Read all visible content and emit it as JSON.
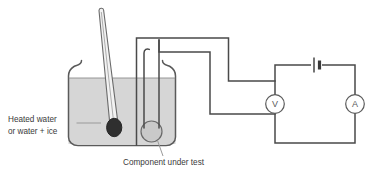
{
  "figure": {
    "type": "physics-apparatus-diagram",
    "colors": {
      "wire": "#4a4a4a",
      "beaker_outline": "#5a5a5a",
      "water_fill": "#d6d6d6",
      "thermometer_bulb": "#2f2f2f",
      "component_fill": "#c9c9c9",
      "label_text": "#3a3a3a",
      "leader_line": "#8a8a8a",
      "background": "#ffffff"
    }
  },
  "labels": {
    "heated_water_line1": "Heated water",
    "heated_water_line2": "or water + ice",
    "component_under_test": "Component under test"
  },
  "meters": {
    "voltmeter_symbol": "V",
    "voltmeter_name": "voltmeter",
    "ammeter_symbol": "A",
    "ammeter_name": "ammeter"
  },
  "components": {
    "battery_name": "battery cell",
    "beaker_name": "beaker",
    "thermometer_name": "thermometer",
    "water_name": "water bath",
    "component_name": "component under test"
  }
}
